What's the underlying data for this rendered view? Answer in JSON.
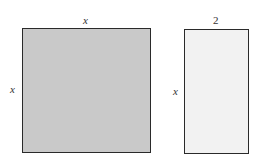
{
  "figure": {
    "square": {
      "top_label": "x",
      "side_label": "x",
      "fill": "#c9c9c9"
    },
    "rectangle": {
      "top_label": "2",
      "side_label": "x",
      "fill": "#f2f2f2"
    }
  }
}
